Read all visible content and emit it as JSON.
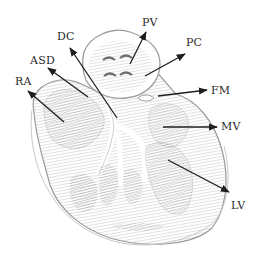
{
  "figure": {
    "type": "anatomical-illustration",
    "colors": {
      "background": "#ffffff",
      "label_text": "#2a2a2a",
      "arrow": "#1e1e1e",
      "shading_dark": "#8a8a8a",
      "shading_mid": "#b5b5b5",
      "shading_light": "#dcdcdc",
      "outline": "#9a9a9a"
    }
  },
  "labels": [
    {
      "id": "DC",
      "text": "DC",
      "x": 57,
      "y": 31
    },
    {
      "id": "PV",
      "text": "PV",
      "x": 150,
      "y": 21
    },
    {
      "id": "ASD",
      "text": "ASD",
      "x": 30,
      "y": 55
    },
    {
      "id": "PC",
      "text": "PC",
      "x": 187,
      "y": 37
    },
    {
      "id": "RA",
      "text": "RA",
      "x": 15,
      "y": 76
    },
    {
      "id": "FM",
      "text": "FM",
      "x": 211,
      "y": 85
    },
    {
      "id": "MV",
      "text": "MV",
      "x": 222,
      "y": 121
    },
    {
      "id": "LV",
      "text": "LV",
      "x": 232,
      "y": 199
    }
  ]
}
